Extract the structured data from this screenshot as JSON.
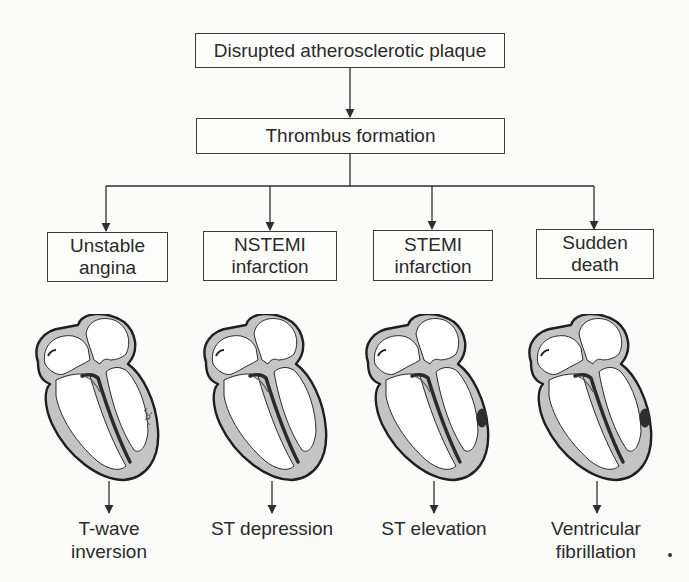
{
  "diagram": {
    "root": {
      "label": "Disrupted atherosclerotic plaque"
    },
    "intermediate": {
      "label": "Thrombus formation"
    },
    "syndromes": [
      {
        "lines": [
          "Unstable",
          "angina"
        ],
        "lesion": "patchy-subendocardial",
        "ecg_lines": [
          "T-wave",
          "inversion"
        ]
      },
      {
        "lines": [
          "NSTEMI",
          "infarction"
        ],
        "lesion": "none-visible",
        "ecg_lines": [
          "ST depression"
        ]
      },
      {
        "lines": [
          "STEMI",
          "infarction"
        ],
        "lesion": "transmural-dark-spot",
        "ecg_lines": [
          "ST elevation"
        ]
      },
      {
        "lines": [
          "Sudden",
          "death"
        ],
        "lesion": "transmural-dark-spot",
        "ecg_lines": [
          "Ventricular",
          "fibrillation"
        ]
      }
    ],
    "colors": {
      "line": "#2e2e2e",
      "myocardium": "#c4c4c4",
      "chamber": "#ffffff",
      "lesion": "#333333",
      "background": "#fbfbfa"
    }
  }
}
